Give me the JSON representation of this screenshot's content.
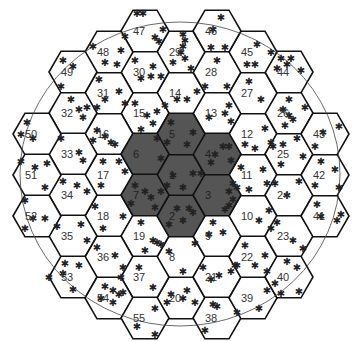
{
  "diagram": {
    "type": "hexagonal-cell-layout",
    "hex_radius": 24,
    "origin": {
      "x": 181,
      "y": 175
    },
    "column_step": 36,
    "row_step": 41,
    "colors": {
      "light_fill": "#ffffff",
      "dark_fill": "#555555",
      "stroke": "#111111"
    },
    "boundary_circle": {
      "cx": 180,
      "cy": 174,
      "rx": 160,
      "ry": 152
    },
    "star_glyph": "✱",
    "cells": [
      {
        "id": "1",
        "c": 0,
        "y": 175,
        "dark": true,
        "stars": [
          [
            -8,
            0
          ],
          [
            2,
            12
          ],
          [
            12,
            -2
          ],
          [
            20,
            -2
          ],
          [
            -14,
            10
          ]
        ]
      },
      {
        "id": "2",
        "c": 0,
        "y": 216,
        "dark": true,
        "stars": [
          [
            -4,
            -8
          ],
          [
            8,
            -8
          ],
          [
            12,
            -4
          ],
          [
            -12,
            8
          ],
          [
            2,
            4
          ]
        ]
      },
      {
        "id": "3",
        "c": 1,
        "y": 195,
        "dark": true,
        "stars": [
          [
            16,
            -12
          ],
          [
            12,
            -4
          ],
          [
            16,
            4
          ],
          [
            12,
            10
          ],
          [
            20,
            -8
          ],
          [
            8,
            14
          ]
        ]
      },
      {
        "id": "4",
        "c": 1,
        "y": 154,
        "dark": true,
        "stars": [
          [
            -2,
            0
          ],
          [
            6,
            -8
          ],
          [
            12,
            -8
          ],
          [
            14,
            6
          ],
          [
            -6,
            8
          ]
        ]
      },
      {
        "id": "5",
        "c": 0,
        "y": 134,
        "dark": true,
        "stars": [
          [
            -10,
            -12
          ],
          [
            12,
            -2
          ],
          [
            6,
            10
          ],
          [
            -14,
            8
          ]
        ]
      },
      {
        "id": "6",
        "c": -1,
        "y": 154,
        "dark": true,
        "stars": [
          [
            12,
            -16
          ],
          [
            16,
            4
          ]
        ]
      },
      {
        "id": "7",
        "c": -1,
        "y": 195,
        "dark": true,
        "stars": [
          [
            -10,
            -10
          ],
          [
            0,
            -4
          ],
          [
            6,
            2
          ],
          [
            -14,
            8
          ],
          [
            10,
            12
          ],
          [
            16,
            -4
          ]
        ]
      },
      {
        "id": "8",
        "c": 0,
        "y": 257,
        "dark": false,
        "stars": [
          [
            -12,
            -6
          ],
          [
            14,
            -14
          ],
          [
            2,
            14
          ]
        ]
      },
      {
        "id": "9",
        "c": 1,
        "y": 236,
        "dark": false,
        "stars": [
          [
            -4,
            -14
          ],
          [
            -8,
            -2
          ],
          [
            6,
            -4
          ]
        ]
      },
      {
        "id": "10",
        "c": 2,
        "y": 216,
        "dark": false,
        "stars": [
          [
            6,
            4
          ],
          [
            16,
            -6
          ]
        ]
      },
      {
        "id": "11",
        "c": 2,
        "y": 175,
        "dark": false,
        "stars": [
          [
            -12,
            -8
          ],
          [
            10,
            -6
          ],
          [
            14,
            8
          ],
          [
            -4,
            14
          ]
        ]
      },
      {
        "id": "12",
        "c": 2,
        "y": 134,
        "dark": false,
        "stars": [
          [
            -8,
            10
          ],
          [
            2,
            14
          ],
          [
            12,
            -6
          ],
          [
            18,
            8
          ]
        ]
      },
      {
        "id": "13",
        "c": 1,
        "y": 113,
        "dark": false,
        "stars": [
          [
            -8,
            4
          ],
          [
            8,
            0
          ],
          [
            12,
            -8
          ],
          [
            14,
            8
          ]
        ]
      },
      {
        "id": "14",
        "c": 0,
        "y": 93,
        "dark": false,
        "stars": [
          [
            -4,
            6
          ],
          [
            6,
            6
          ],
          [
            16,
            -2
          ],
          [
            -16,
            12
          ]
        ]
      },
      {
        "id": "15",
        "c": -1,
        "y": 113,
        "dark": false,
        "stars": [
          [
            -10,
            -10
          ],
          [
            2,
            2
          ],
          [
            12,
            -2
          ],
          [
            8,
            10
          ],
          [
            -4,
            16
          ]
        ]
      },
      {
        "id": "16",
        "c": -2,
        "y": 134,
        "dark": false,
        "stars": [
          [
            -12,
            -4
          ],
          [
            -4,
            2
          ],
          [
            2,
            8
          ],
          [
            6,
            10
          ],
          [
            -16,
            6
          ]
        ]
      },
      {
        "id": "17",
        "c": -2,
        "y": 175,
        "dark": false,
        "stars": [
          [
            -6,
            -14
          ],
          [
            10,
            -14
          ],
          [
            16,
            -4
          ],
          [
            -8,
            10
          ]
        ]
      },
      {
        "id": "18",
        "c": -2,
        "y": 216,
        "dark": false,
        "stars": [
          [
            -14,
            -10
          ],
          [
            -6,
            12
          ],
          [
            14,
            0
          ]
        ]
      },
      {
        "id": "19",
        "c": -1,
        "y": 236,
        "dark": false,
        "stars": [
          [
            -4,
            -14
          ],
          [
            8,
            4
          ],
          [
            12,
            6
          ],
          [
            16,
            8
          ],
          [
            0,
            14
          ]
        ]
      },
      {
        "id": "20",
        "c": 0,
        "y": 298,
        "dark": false,
        "stars": [
          [
            -10,
            -4
          ],
          [
            6,
            -8
          ],
          [
            -14,
            4
          ],
          [
            2,
            0
          ],
          [
            14,
            4
          ]
        ]
      },
      {
        "id": "21",
        "c": 1,
        "y": 277,
        "dark": false,
        "stars": [
          [
            -6,
            2
          ],
          [
            2,
            -2
          ],
          [
            14,
            -6
          ],
          [
            -14,
            -10
          ],
          [
            18,
            -12
          ]
        ]
      },
      {
        "id": "22",
        "c": 2,
        "y": 257,
        "dark": false,
        "stars": [
          [
            -8,
            -12
          ],
          [
            -16,
            8
          ],
          [
            2,
            8
          ],
          [
            12,
            -2
          ],
          [
            14,
            14
          ]
        ]
      },
      {
        "id": "23",
        "c": 3,
        "y": 236,
        "dark": false,
        "stars": [
          [
            -18,
            -8
          ],
          [
            4,
            4
          ],
          [
            -12,
            -14
          ],
          [
            14,
            12
          ]
        ]
      },
      {
        "id": "24",
        "c": 3,
        "y": 195,
        "dark": false,
        "stars": [
          [
            -2,
            0
          ],
          [
            -14,
            -12
          ],
          [
            10,
            -14
          ]
        ]
      },
      {
        "id": "25",
        "c": 3,
        "y": 154,
        "dark": false,
        "stars": [
          [
            -16,
            -8
          ],
          [
            -6,
            -10
          ],
          [
            8,
            -16
          ],
          [
            -8,
            10
          ],
          [
            14,
            2
          ]
        ]
      },
      {
        "id": "26",
        "c": 3,
        "y": 113,
        "dark": false,
        "stars": [
          [
            0,
            -14
          ],
          [
            -6,
            -4
          ],
          [
            0,
            2
          ],
          [
            4,
            6
          ],
          [
            -4,
            12
          ],
          [
            16,
            -6
          ]
        ]
      },
      {
        "id": "27",
        "c": 2,
        "y": 93,
        "dark": false,
        "stars": [
          [
            -4,
            -12
          ],
          [
            8,
            6
          ]
        ]
      },
      {
        "id": "28",
        "c": 1,
        "y": 72,
        "dark": false,
        "stars": [
          [
            0,
            -12
          ],
          [
            -12,
            14
          ],
          [
            10,
            14
          ]
        ]
      },
      {
        "id": "29",
        "c": 0,
        "y": 52,
        "dark": false,
        "stars": [
          [
            2,
            -18
          ],
          [
            4,
            -12
          ],
          [
            2,
            -6
          ],
          [
            0,
            0
          ],
          [
            4,
            6
          ],
          [
            10,
            16
          ],
          [
            -8,
            10
          ]
        ]
      },
      {
        "id": "30",
        "c": -1,
        "y": 72,
        "dark": false,
        "stars": [
          [
            -10,
            -12
          ],
          [
            8,
            -6
          ],
          [
            -4,
            6
          ],
          [
            6,
            4
          ],
          [
            16,
            4
          ]
        ]
      },
      {
        "id": "31",
        "c": -2,
        "y": 93,
        "dark": false,
        "stars": [
          [
            -10,
            -14
          ],
          [
            -4,
            6
          ],
          [
            10,
            -2
          ],
          [
            16,
            10
          ],
          [
            -12,
            14
          ]
        ]
      },
      {
        "id": "32",
        "c": -3,
        "y": 113,
        "dark": false,
        "stars": [
          [
            -2,
            -14
          ],
          [
            6,
            -4
          ],
          [
            14,
            -6
          ],
          [
            10,
            4
          ]
        ]
      },
      {
        "id": "33",
        "c": -3,
        "y": 154,
        "dark": false,
        "stars": [
          [
            6,
            -2
          ],
          [
            10,
            6
          ],
          [
            -12,
            -16
          ]
        ]
      },
      {
        "id": "34",
        "c": -3,
        "y": 195,
        "dark": false,
        "stars": [
          [
            -10,
            -14
          ],
          [
            4,
            -10
          ],
          [
            14,
            -4
          ]
        ]
      },
      {
        "id": "35",
        "c": -3,
        "y": 236,
        "dark": false,
        "stars": [
          [
            -16,
            -10
          ],
          [
            8,
            -12
          ],
          [
            14,
            4
          ]
        ]
      },
      {
        "id": "36",
        "c": -2,
        "y": 257,
        "dark": false,
        "stars": [
          [
            -12,
            -10
          ],
          [
            6,
            -2
          ],
          [
            14,
            10
          ]
        ]
      },
      {
        "id": "37",
        "c": -1,
        "y": 277,
        "dark": false,
        "stars": [
          [
            -24,
            0
          ],
          [
            -6,
            -10
          ],
          [
            8,
            10
          ]
        ]
      },
      {
        "id": "38",
        "c": 1,
        "y": 318,
        "dark": false,
        "stars": [
          [
            -4,
            -14
          ],
          [
            0,
            -12
          ],
          [
            -12,
            12
          ]
        ]
      },
      {
        "id": "39",
        "c": 2,
        "y": 298,
        "dark": false,
        "stars": [
          [
            6,
            10
          ],
          [
            -16,
            14
          ],
          [
            14,
            -8
          ]
        ]
      },
      {
        "id": "40",
        "c": 3,
        "y": 277,
        "dark": false,
        "stars": [
          [
            -2,
            -16
          ],
          [
            8,
            -10
          ],
          [
            -14,
            6
          ],
          [
            10,
            14
          ],
          [
            -8,
            16
          ]
        ]
      },
      {
        "id": "41",
        "c": 4,
        "y": 216,
        "dark": false,
        "stars": [
          [
            -4,
            0
          ],
          [
            12,
            4
          ],
          [
            16,
            -2
          ],
          [
            -8,
            -12
          ]
        ]
      },
      {
        "id": "42",
        "c": 4,
        "y": 175,
        "dark": false,
        "stars": [
          [
            -4,
            -14
          ],
          [
            10,
            -6
          ],
          [
            14,
            12
          ],
          [
            -10,
            10
          ]
        ]
      },
      {
        "id": "43",
        "c": 4,
        "y": 134,
        "dark": false,
        "stars": [
          [
            -2,
            -2
          ],
          [
            14,
            -8
          ],
          [
            -10,
            12
          ]
        ]
      },
      {
        "id": "44",
        "c": 3,
        "y": 72,
        "dark": false,
        "stars": [
          [
            -8,
            -14
          ],
          [
            2,
            -14
          ],
          [
            -12,
            -4
          ],
          [
            12,
            -2
          ],
          [
            -2,
            -8
          ]
        ]
      },
      {
        "id": "45",
        "c": 2,
        "y": 52,
        "dark": false,
        "stars": [
          [
            4,
            -8
          ],
          [
            -6,
            12
          ],
          [
            2,
            12
          ],
          [
            18,
            0
          ]
        ]
      },
      {
        "id": "46",
        "c": 1,
        "y": 31,
        "dark": false,
        "stars": [
          [
            4,
            -14
          ],
          [
            -4,
            -2
          ],
          [
            8,
            16
          ],
          [
            -6,
            16
          ]
        ]
      },
      {
        "id": "47",
        "c": -1,
        "y": 31,
        "dark": false,
        "stars": [
          [
            -8,
            -18
          ],
          [
            -2,
            -18
          ],
          [
            10,
            6
          ],
          [
            14,
            10
          ],
          [
            18,
            -2
          ]
        ]
      },
      {
        "id": "48",
        "c": -2,
        "y": 52,
        "dark": false,
        "stars": [
          [
            12,
            -2
          ],
          [
            -4,
            10
          ],
          [
            8,
            12
          ],
          [
            -16,
            -6
          ],
          [
            16,
            -16
          ]
        ]
      },
      {
        "id": "49",
        "c": -3,
        "y": 72,
        "dark": false,
        "stars": [
          [
            -10,
            -12
          ],
          [
            0,
            -6
          ],
          [
            -12,
            14
          ]
        ]
      },
      {
        "id": "50",
        "c": -4,
        "y": 134,
        "dark": false,
        "stars": [
          [
            -16,
            0
          ],
          [
            -10,
            -12
          ],
          [
            -4,
            4
          ]
        ]
      },
      {
        "id": "51",
        "c": -4,
        "y": 175,
        "dark": false,
        "stars": [
          [
            -2,
            -8
          ],
          [
            -16,
            -14
          ],
          [
            10,
            -12
          ],
          [
            8,
            12
          ]
        ]
      },
      {
        "id": "52",
        "c": -4,
        "y": 216,
        "dark": false,
        "stars": [
          [
            -12,
            -16
          ],
          [
            -12,
            12
          ],
          [
            -4,
            2
          ],
          [
            8,
            2
          ]
        ]
      },
      {
        "id": "53",
        "c": -3,
        "y": 277,
        "dark": false,
        "stars": [
          [
            -10,
            -4
          ],
          [
            -24,
            0
          ],
          [
            6,
            -12
          ],
          [
            -8,
            -14
          ],
          [
            0,
            12
          ]
        ]
      },
      {
        "id": "54",
        "c": -2,
        "y": 298,
        "dark": false,
        "stars": [
          [
            -4,
            -12
          ],
          [
            4,
            -8
          ],
          [
            10,
            -4
          ],
          [
            -8,
            0
          ],
          [
            4,
            4
          ],
          [
            14,
            -6
          ]
        ]
      },
      {
        "id": "55",
        "c": -1,
        "y": 318,
        "dark": false,
        "stars": [
          [
            10,
            -10
          ],
          [
            -8,
            8
          ],
          [
            10,
            16
          ]
        ]
      }
    ]
  }
}
